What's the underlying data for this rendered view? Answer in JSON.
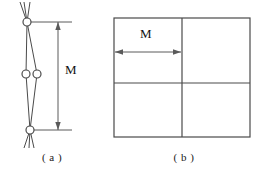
{
  "figure": {
    "panels": [
      {
        "id": "a",
        "caption": "( a )",
        "dimension_label": "M",
        "description": "lattice-lens-with-vertical-dimension",
        "geometry": {
          "nodes": [
            {
              "name": "top-node",
              "cx": 27,
              "cy": 22,
              "r": 4
            },
            {
              "name": "middle-left-node",
              "cx": 26,
              "cy": 74,
              "r": 4
            },
            {
              "name": "middle-right-node",
              "cx": 37,
              "cy": 74,
              "r": 4
            },
            {
              "name": "bottom-node",
              "cx": 30,
              "cy": 130,
              "r": 4
            }
          ],
          "dimension_line_x": 58,
          "dimension_top_y": 22,
          "dimension_bottom_y": 130
        }
      },
      {
        "id": "b",
        "caption": "( b )",
        "dimension_label": "M",
        "description": "square-divided-into-four-quadrants-with-horizontal-dimension",
        "geometry": {
          "square": {
            "left": 10,
            "top": 18,
            "right": 146,
            "bottom": 137
          },
          "vertical_divider_x": 78,
          "horizontal_divider_y": 83,
          "dimension_line_y": 52,
          "dimension_left_x": 11,
          "dimension_right_x": 77
        }
      }
    ],
    "colors": {
      "stroke": "#4a4a4a",
      "dimension_stroke": "#5a5a5a",
      "node_fill": "#ffffff",
      "background": "#ffffff",
      "text": "#1a1a1a"
    }
  }
}
